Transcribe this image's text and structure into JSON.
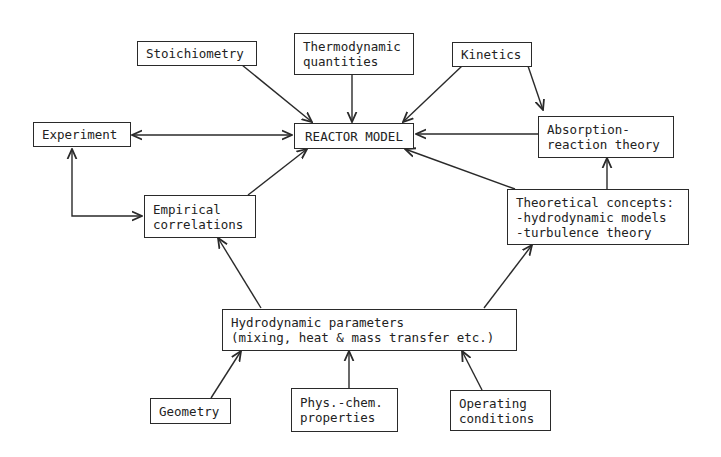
{
  "diagram": {
    "nodes": {
      "stoichiometry": {
        "lines": [
          "Stoichiometry"
        ]
      },
      "thermodynamic": {
        "lines": [
          "Thermodynamic",
          "quantities"
        ]
      },
      "kinetics": {
        "lines": [
          "Kinetics"
        ]
      },
      "experiment": {
        "lines": [
          "Experiment"
        ]
      },
      "reactor_model": {
        "lines": [
          "REACTOR MODEL"
        ]
      },
      "absorption": {
        "lines": [
          "Absorption-",
          "reaction theory"
        ]
      },
      "empirical": {
        "lines": [
          "Empirical",
          "correlations"
        ]
      },
      "theoretical": {
        "lines": [
          "Theoretical concepts:",
          "-hydrodynamic models",
          "-turbulence theory"
        ]
      },
      "hydrodynamic": {
        "lines": [
          "Hydrodynamic parameters",
          "(mixing, heat & mass transfer etc.)"
        ]
      },
      "geometry": {
        "lines": [
          "Geometry"
        ]
      },
      "physchem": {
        "lines": [
          "Phys.-chem.",
          "properties"
        ]
      },
      "operating": {
        "lines": [
          "Operating",
          "conditions"
        ]
      }
    },
    "edges": [
      {
        "from": "stoichiometry",
        "to": "reactor_model"
      },
      {
        "from": "thermodynamic",
        "to": "reactor_model"
      },
      {
        "from": "kinetics",
        "to": "reactor_model"
      },
      {
        "from": "kinetics",
        "to": "absorption"
      },
      {
        "from": "experiment",
        "to": "reactor_model",
        "bidirectional": true
      },
      {
        "from": "absorption",
        "to": "reactor_model"
      },
      {
        "from": "experiment",
        "to": "empirical",
        "bidirectional": true
      },
      {
        "from": "empirical",
        "to": "reactor_model"
      },
      {
        "from": "theoretical",
        "to": "reactor_model"
      },
      {
        "from": "theoretical",
        "to": "absorption"
      },
      {
        "from": "hydrodynamic",
        "to": "empirical"
      },
      {
        "from": "hydrodynamic",
        "to": "theoretical"
      },
      {
        "from": "geometry",
        "to": "hydrodynamic"
      },
      {
        "from": "physchem",
        "to": "hydrodynamic"
      },
      {
        "from": "operating",
        "to": "hydrodynamic"
      }
    ],
    "colors": {
      "line": "#2a2a2a",
      "text": "#222222",
      "background": "#ffffff"
    }
  }
}
